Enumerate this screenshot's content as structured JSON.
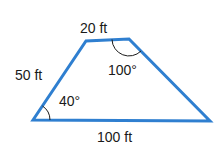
{
  "figure": {
    "shape": "trapezoid",
    "stroke_color": "#2f7fd0",
    "sides": {
      "top": "20 ft",
      "left": "50 ft",
      "bottom": "100 ft"
    },
    "angles": {
      "bottom_left": "40°",
      "top_right": "100°"
    }
  }
}
